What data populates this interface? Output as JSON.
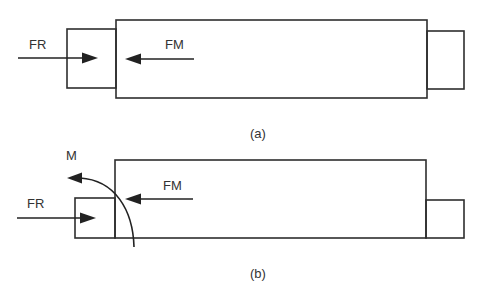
{
  "diagrams": [
    {
      "id": "a",
      "caption": "(a)",
      "labels": {
        "fr": "FR",
        "fm": "FM"
      },
      "shapes": {
        "left_block": {
          "x": 67,
          "y": 29,
          "w": 49,
          "h": 59
        },
        "main_block": {
          "x": 116,
          "y": 20,
          "w": 311,
          "h": 78
        },
        "right_block": {
          "x": 427,
          "y": 31,
          "w": 37,
          "h": 58
        }
      },
      "forces": [
        {
          "name": "FR",
          "direction": "right"
        },
        {
          "name": "FM",
          "direction": "left"
        }
      ]
    },
    {
      "id": "b",
      "caption": "(b)",
      "labels": {
        "fr": "FR",
        "fm": "FM",
        "m": "M"
      },
      "shapes": {
        "left_block": {
          "x": 75,
          "y": 198,
          "w": 40,
          "h": 40
        },
        "main_block": {
          "x": 115,
          "y": 160,
          "w": 311,
          "h": 78
        },
        "right_block": {
          "x": 426,
          "y": 200,
          "w": 38,
          "h": 38
        }
      },
      "forces": [
        {
          "name": "FR",
          "direction": "right"
        },
        {
          "name": "FM",
          "direction": "left"
        },
        {
          "name": "M",
          "direction": "counter-clockwise moment"
        }
      ]
    }
  ],
  "colors": {
    "stroke": "#2e2e2e",
    "text": "#333333",
    "background": "#ffffff"
  }
}
